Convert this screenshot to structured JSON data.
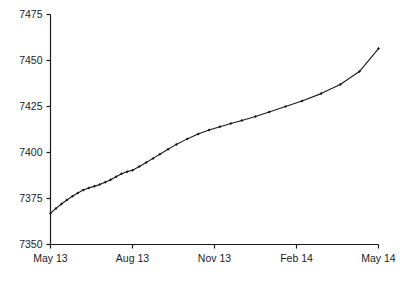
{
  "chart_data": {
    "type": "line",
    "title": "",
    "subtitle": "",
    "xlabel": "",
    "ylabel": "",
    "grid": false,
    "legend": "none",
    "line_color": "#1a1a1a",
    "marker_color": "#1a1a1a",
    "marker": "diamond",
    "background": "#ffffff",
    "axis_color": "#1a1a1a",
    "xlim_labels": [
      "May 13",
      "May 14"
    ],
    "ylim": [
      7350,
      7475
    ],
    "yticks": [
      7350,
      7375,
      7400,
      7425,
      7450,
      7475
    ],
    "ytick_labels": [
      "7350",
      "7375",
      "7400",
      "7425",
      "7450",
      "7475"
    ],
    "xticks": [
      "May 13",
      "Aug 13",
      "Nov 13",
      "Feb 14",
      "May 14"
    ],
    "xtick_positions": [
      0,
      3,
      6,
      9,
      12
    ],
    "x": [
      0.0,
      0.2,
      0.4,
      0.6,
      0.8,
      1.0,
      1.2,
      1.4,
      1.6,
      1.8,
      2.0,
      2.2,
      2.4,
      2.6,
      2.8,
      3.0,
      3.25,
      3.5,
      3.75,
      4.0,
      4.3,
      4.6,
      5.0,
      5.4,
      5.8,
      6.2,
      6.6,
      7.0,
      7.5,
      8.0,
      8.6,
      9.2,
      9.9,
      10.6,
      11.3,
      12.0
    ],
    "values": [
      7367.0,
      7369.6,
      7372.0,
      7374.2,
      7376.2,
      7378.0,
      7379.6,
      7380.7,
      7381.6,
      7382.6,
      7383.8,
      7385.2,
      7386.8,
      7388.4,
      7389.6,
      7390.4,
      7392.4,
      7394.6,
      7396.8,
      7399.0,
      7401.8,
      7404.4,
      7407.4,
      7410.0,
      7412.2,
      7414.0,
      7415.8,
      7417.4,
      7419.6,
      7422.0,
      7425.0,
      7428.0,
      7432.0,
      7437.0,
      7444.0,
      7456.5
    ],
    "series": [
      {
        "name": "series-1",
        "values": [
          7367.0,
          7369.6,
          7372.0,
          7374.2,
          7376.2,
          7378.0,
          7379.6,
          7380.7,
          7381.6,
          7382.6,
          7383.8,
          7385.2,
          7386.8,
          7388.4,
          7389.6,
          7390.4,
          7392.4,
          7394.6,
          7396.8,
          7399.0,
          7401.8,
          7404.4,
          7407.4,
          7410.0,
          7412.2,
          7414.0,
          7415.8,
          7417.4,
          7419.6,
          7422.0,
          7425.0,
          7428.0,
          7432.0,
          7437.0,
          7444.0,
          7456.5
        ]
      }
    ],
    "first_value": 7367.0,
    "last_value": 7456.5
  },
  "axes": {
    "y_labels": [
      "7475",
      "7450",
      "7425",
      "7400",
      "7375",
      "7350"
    ],
    "x_labels": [
      "May 13",
      "Aug 13",
      "Nov 13",
      "Feb 14",
      "May 14"
    ]
  }
}
